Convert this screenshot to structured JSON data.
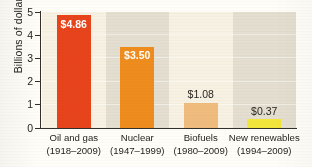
{
  "chart_data": {
    "type": "bar",
    "title": "",
    "xlabel": "",
    "ylabel": "Billions of dollars",
    "ylim": [
      0,
      5
    ],
    "yticks": [
      "0",
      "1",
      "2",
      "3",
      "4",
      "5"
    ],
    "grid": true,
    "legend": "none",
    "categories": [
      "Oil and gas",
      "Nuclear",
      "Biofuels",
      "New renewables"
    ],
    "category_years": [
      "(1918–2009)",
      "(1947–1999)",
      "(1980–2009)",
      "(1994–2009)"
    ],
    "values": [
      4.86,
      3.5,
      1.08,
      0.37
    ],
    "value_labels": [
      "$4.86",
      "$3.50",
      "$1.08",
      "$0.37"
    ],
    "bar_colors": [
      "#e8441c",
      "#ee8c1e",
      "#efbc7e",
      "#f2e63c"
    ],
    "label_placement": [
      "inside",
      "inside",
      "outside",
      "outside"
    ],
    "band_colors": [
      "#f6f1e2",
      "#e4ded0"
    ],
    "axis_color": "#33302b"
  }
}
